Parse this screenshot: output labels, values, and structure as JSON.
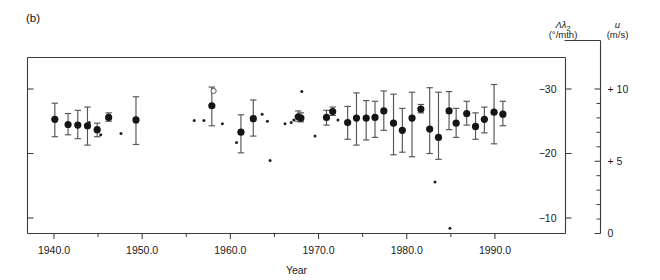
{
  "figure": {
    "panel_label": "(b)",
    "background": "#ffffff"
  },
  "axes": {
    "x": {
      "title": "Year",
      "ticks": [
        "1940.0",
        "1950.0",
        "1960.0",
        "1970.0",
        "1980.0",
        "1990.0"
      ],
      "tick_values": [
        1940,
        1950,
        1960,
        1970,
        1980,
        1990
      ],
      "minor_tick_values": [
        1945,
        1955,
        1965,
        1975,
        1985
      ],
      "range": [
        1937.0,
        1998.0
      ]
    },
    "y_left": {
      "symbol": "Λλ",
      "symbol_sub": "2",
      "unit": "(°/mth)",
      "ticks": [
        "−30",
        "−20",
        "−10"
      ],
      "tick_values": [
        -30,
        -20,
        -10
      ],
      "range": [
        -7.0,
        -34.5
      ]
    },
    "y_right": {
      "symbol": "u",
      "unit": "(m/s)",
      "ticks": [
        "+ 10",
        "+ 5",
        "0"
      ],
      "tick_values": [
        10,
        5,
        0
      ],
      "minor_tick_values": [
        9,
        8,
        7,
        6,
        4,
        3,
        2,
        1
      ],
      "range": [
        0,
        11.7
      ]
    }
  },
  "chart_data": {
    "type": "scatter",
    "title": "",
    "xlabel": "Year",
    "ylabel": "Λλ2 (°/mth)",
    "ylabel_secondary": "u (m/s)",
    "xlim": [
      1937.0,
      1998.0
    ],
    "ylim": [
      -34.5,
      -7.0
    ],
    "ylim_secondary": [
      0,
      11.7
    ],
    "grid": false,
    "legend": null,
    "series": [
      {
        "name": "mean with error bars",
        "marker": "filled-circle",
        "points": [
          {
            "x": 1940.1,
            "y": -25.3,
            "yerr_low": -22.6,
            "yerr_high": -27.8
          },
          {
            "x": 1941.6,
            "y": -24.5,
            "yerr_low": -22.9,
            "yerr_high": -26.2
          },
          {
            "x": 1942.7,
            "y": -24.4,
            "yerr_low": -22.3,
            "yerr_high": -26.7
          },
          {
            "x": 1943.8,
            "y": -24.3,
            "yerr_low": -21.3,
            "yerr_high": -27.2
          },
          {
            "x": 1944.9,
            "y": -23.7,
            "yerr_low": -22.6,
            "yerr_high": -24.7
          },
          {
            "x": 1946.2,
            "y": -25.6,
            "yerr_low": -25.0,
            "yerr_high": -26.3
          },
          {
            "x": 1949.3,
            "y": -25.2,
            "yerr_low": -21.4,
            "yerr_high": -28.8
          },
          {
            "x": 1957.9,
            "y": -27.4,
            "yerr_low": -24.3,
            "yerr_high": -30.3
          },
          {
            "x": 1961.2,
            "y": -23.3,
            "yerr_low": -20.1,
            "yerr_high": -26.0
          },
          {
            "x": 1962.6,
            "y": -25.4,
            "yerr_low": -22.7,
            "yerr_high": -28.3
          },
          {
            "x": 1967.7,
            "y": -25.7,
            "yerr_low": -25.0,
            "yerr_high": -26.6
          },
          {
            "x": 1968.0,
            "y": -25.5,
            "yerr_low": -24.9,
            "yerr_high": -26.3
          },
          {
            "x": 1970.9,
            "y": -25.6,
            "yerr_low": -24.4,
            "yerr_high": -26.7
          },
          {
            "x": 1971.6,
            "y": -26.5,
            "yerr_low": -25.9,
            "yerr_high": -27.2
          },
          {
            "x": 1973.3,
            "y": -24.8,
            "yerr_low": -22.2,
            "yerr_high": -27.3
          },
          {
            "x": 1974.3,
            "y": -25.5,
            "yerr_low": -21.3,
            "yerr_high": -29.4
          },
          {
            "x": 1975.4,
            "y": -25.5,
            "yerr_low": -22.1,
            "yerr_high": -28.2
          },
          {
            "x": 1976.4,
            "y": -25.6,
            "yerr_low": -22.5,
            "yerr_high": -28.1
          },
          {
            "x": 1977.4,
            "y": -26.6,
            "yerr_low": -23.6,
            "yerr_high": -29.7
          },
          {
            "x": 1978.5,
            "y": -24.7,
            "yerr_low": -19.8,
            "yerr_high": -29.2
          },
          {
            "x": 1979.5,
            "y": -23.6,
            "yerr_low": -20.2,
            "yerr_high": -27.0
          },
          {
            "x": 1980.6,
            "y": -25.5,
            "yerr_low": -19.5,
            "yerr_high": -29.5
          },
          {
            "x": 1981.6,
            "y": -26.9,
            "yerr_low": -26.3,
            "yerr_high": -27.6
          },
          {
            "x": 1982.6,
            "y": -23.8,
            "yerr_low": -20.0,
            "yerr_high": -30.2
          },
          {
            "x": 1983.6,
            "y": -22.5,
            "yerr_low": -19.1,
            "yerr_high": -29.5
          },
          {
            "x": 1984.8,
            "y": -26.6,
            "yerr_low": -23.7,
            "yerr_high": -29.6
          },
          {
            "x": 1985.6,
            "y": -24.7,
            "yerr_low": -22.5,
            "yerr_high": -27.0
          },
          {
            "x": 1986.8,
            "y": -26.2,
            "yerr_low": -24.4,
            "yerr_high": -28.1
          },
          {
            "x": 1987.8,
            "y": -24.2,
            "yerr_low": -22.2,
            "yerr_high": -26.3
          },
          {
            "x": 1988.8,
            "y": -25.3,
            "yerr_low": -23.2,
            "yerr_high": -27.2
          },
          {
            "x": 1989.9,
            "y": -26.4,
            "yerr_low": -21.5,
            "yerr_high": -30.7
          },
          {
            "x": 1990.9,
            "y": -26.1,
            "yerr_low": -24.3,
            "yerr_high": -28.1
          }
        ]
      },
      {
        "name": "individual measurements",
        "marker": "small-dot",
        "points": [
          {
            "x": 1944.0,
            "y": -24.8
          },
          {
            "x": 1945.3,
            "y": -22.9
          },
          {
            "x": 1947.6,
            "y": -23.1
          },
          {
            "x": 1955.9,
            "y": -25.1
          },
          {
            "x": 1957.0,
            "y": -25.1
          },
          {
            "x": 1959.1,
            "y": -24.6
          },
          {
            "x": 1960.7,
            "y": -21.7
          },
          {
            "x": 1963.6,
            "y": -26.1
          },
          {
            "x": 1964.2,
            "y": -25.0
          },
          {
            "x": 1964.5,
            "y": -18.9
          },
          {
            "x": 1966.2,
            "y": -24.6
          },
          {
            "x": 1966.9,
            "y": -24.8
          },
          {
            "x": 1967.2,
            "y": -25.2
          },
          {
            "x": 1968.1,
            "y": -29.6
          },
          {
            "x": 1969.6,
            "y": -22.7
          },
          {
            "x": 1972.2,
            "y": -25.2
          },
          {
            "x": 1983.2,
            "y": -15.6
          },
          {
            "x": 1984.9,
            "y": -8.4
          }
        ]
      },
      {
        "name": "excluded measurement",
        "marker": "open-circle",
        "points": [
          {
            "x": 1958.1,
            "y": -29.7
          }
        ]
      }
    ]
  }
}
